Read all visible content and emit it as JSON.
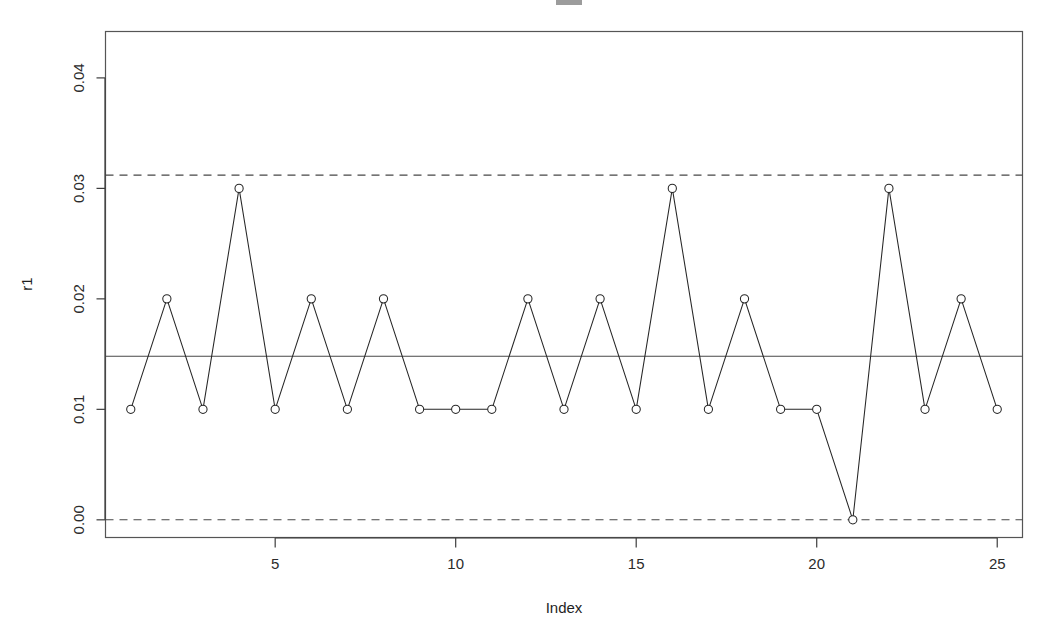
{
  "chart_data": {
    "type": "line",
    "title": "",
    "xlabel": "Index",
    "ylabel": "r1",
    "x": [
      1,
      2,
      3,
      4,
      5,
      6,
      7,
      8,
      9,
      10,
      11,
      12,
      13,
      14,
      15,
      16,
      17,
      18,
      19,
      20,
      21,
      22,
      23,
      24,
      25
    ],
    "values": [
      0.01,
      0.02,
      0.01,
      0.03,
      0.01,
      0.02,
      0.01,
      0.02,
      0.01,
      0.01,
      0.01,
      0.02,
      0.01,
      0.02,
      0.01,
      0.03,
      0.01,
      0.02,
      0.01,
      0.01,
      0.0,
      0.03,
      0.01,
      0.02,
      0.01
    ],
    "series": [
      {
        "name": "r1",
        "values": [
          0.01,
          0.02,
          0.01,
          0.03,
          0.01,
          0.02,
          0.01,
          0.02,
          0.01,
          0.01,
          0.01,
          0.02,
          0.01,
          0.02,
          0.01,
          0.03,
          0.01,
          0.02,
          0.01,
          0.01,
          0.0,
          0.03,
          0.01,
          0.02,
          0.01
        ]
      }
    ],
    "reference_lines": [
      {
        "name": "UCL",
        "value": 0.0312,
        "style": "dashed",
        "label": ""
      },
      {
        "name": "CL",
        "value": 0.0148,
        "style": "solid",
        "label": ""
      },
      {
        "name": "LCL",
        "value": 0.0,
        "style": "dashed",
        "label": ""
      }
    ],
    "xlim": [
      0.3,
      25.7
    ],
    "ylim": [
      -0.0016,
      0.0442
    ],
    "xticks": [
      5,
      10,
      15,
      20,
      25
    ],
    "xtick_labels": [
      "5",
      "10",
      "15",
      "20",
      "25"
    ],
    "yticks": [
      0.0,
      0.01,
      0.02,
      0.03,
      0.04
    ],
    "ytick_labels": [
      "0.00",
      "0.01",
      "0.02",
      "0.03",
      "0.04"
    ],
    "grid": false,
    "legend": "none",
    "marker": "open-circle",
    "line_color": "#262626",
    "marker_color": "#262626",
    "background": "#ffffff"
  },
  "labels": {
    "y_axis_title": "r1",
    "x_axis_title": "Index",
    "tick_00": "0.00",
    "tick_01": "0.01",
    "tick_02": "0.02",
    "tick_03": "0.03",
    "tick_04": "0.04",
    "xtick_5": "5",
    "xtick_10": "10",
    "xtick_15": "15",
    "xtick_20": "20",
    "xtick_25": "25"
  }
}
